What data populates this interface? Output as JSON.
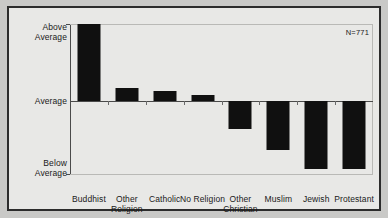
{
  "chart_data": {
    "type": "bar",
    "title": "",
    "xlabel": "",
    "ylabel": "",
    "categories": [
      "Buddhist",
      "Other\nReligion",
      "Catholic",
      "No Religion",
      "Other\nChristian",
      "Muslim",
      "Jewish",
      "Protestant"
    ],
    "values": [
      1.0,
      0.17,
      0.13,
      0.08,
      -0.37,
      -0.63,
      -0.88,
      -0.88
    ],
    "ylim": [
      -1,
      1
    ],
    "ytick_labels": [
      "Above\nAverage",
      "Average",
      "Below\nAverage"
    ],
    "ytick_values": [
      1,
      0,
      -1
    ],
    "grid": false,
    "legend": null,
    "annotations": [
      "N=771"
    ],
    "bar_color": "#101010",
    "background_color": "#e8e8e6"
  },
  "annotation": {
    "sample_size": "N=771"
  },
  "axis": {
    "above_label": "Above\nAverage",
    "average_label": "Average",
    "below_label": "Below\nAverage"
  }
}
